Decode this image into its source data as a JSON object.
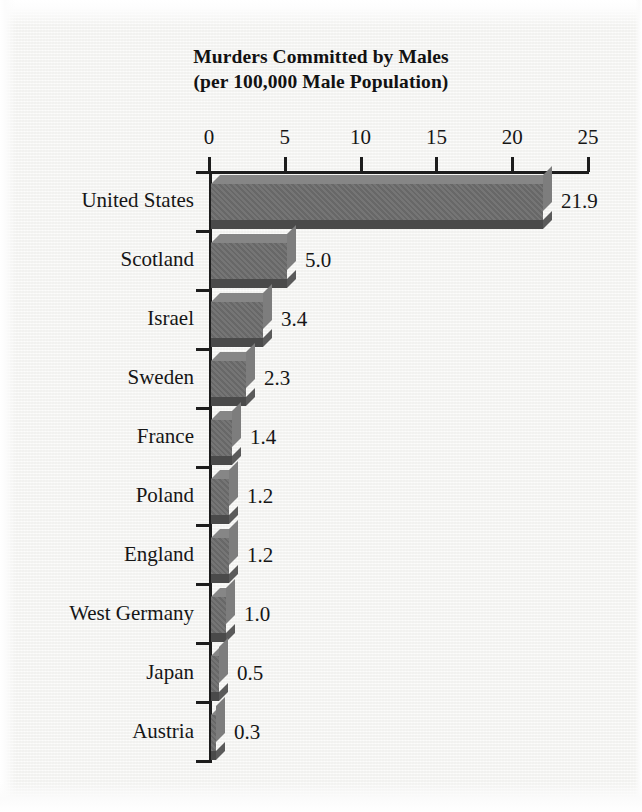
{
  "chart_data": {
    "type": "bar",
    "orientation": "horizontal",
    "title": "Murders Committed by Males",
    "subtitle": "(per 100,000 Male Population)",
    "xlabel": "",
    "ylabel": "",
    "xlim": [
      0,
      25
    ],
    "xticks": [
      0,
      5,
      10,
      15,
      20,
      25
    ],
    "grid": false,
    "legend": null,
    "categories": [
      "United States",
      "Scotland",
      "Israel",
      "Sweden",
      "France",
      "Poland",
      "England",
      "West Germany",
      "Japan",
      "Austria"
    ],
    "values": [
      21.9,
      5.0,
      3.4,
      2.3,
      1.4,
      1.2,
      1.2,
      1.0,
      0.5,
      0.3
    ],
    "value_labels": [
      "21.9",
      "5.0",
      "3.4",
      "2.3",
      "1.4",
      "1.2",
      "1.2",
      "1.0",
      "0.5",
      "0.3"
    ]
  },
  "style": {
    "bar_face": "#6d6d6d",
    "bar_top": "#868686",
    "bar_side": "#7d7d7d",
    "bar_shadow": "#4a4a4a",
    "axis": "#1d1d1d",
    "text": "#161616",
    "background": "#f4f4f2"
  }
}
